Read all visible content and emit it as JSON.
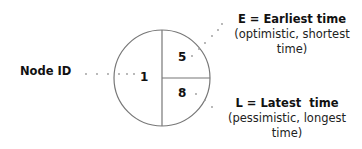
{
  "diagram": {
    "type": "network-node-legend",
    "node": {
      "id_value": "1",
      "earliest_value": "5",
      "latest_value": "8"
    },
    "labels": {
      "node_id": "Node ID"
    },
    "legend": {
      "earliest": {
        "title": "E = Earliest time",
        "desc_line1": "(optimistic, shortest",
        "desc_line2": "time)"
      },
      "latest": {
        "title": "L = Latest  time",
        "desc_line1": "(pessimistic, longest",
        "desc_line2": "time)"
      }
    },
    "colors": {
      "stroke": "#777777",
      "text": "#111111",
      "leader_dots": "#999999"
    }
  }
}
